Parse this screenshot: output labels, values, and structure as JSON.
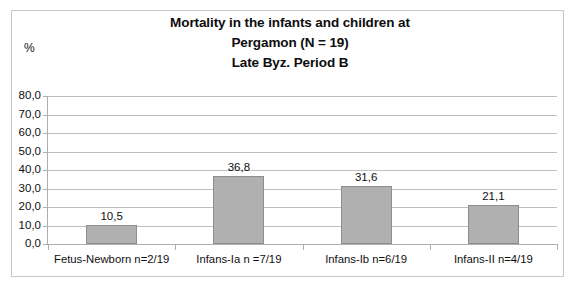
{
  "chart_data": {
    "type": "bar",
    "title": "Mortality in the infants and children at Pergamon  (N = 19) Late Byz. Period B",
    "title_lines": [
      "Mortality in the infants and children at",
      "Pergamon  (N = 19)",
      "Late Byz. Period B"
    ],
    "categories": [
      "Fetus-Newborn n=2/19",
      "Infans-Ia n =7/19",
      "Infans-Ib n=6/19",
      "Infans-II n=4/19"
    ],
    "values": [
      10.5,
      36.8,
      31.6,
      21.1
    ],
    "value_labels": [
      "10,5",
      "36,8",
      "31,6",
      "21,1"
    ],
    "xlabel": "",
    "ylabel": "%",
    "ylim": [
      0,
      80
    ],
    "ytick_values": [
      0,
      10,
      20,
      30,
      40,
      50,
      60,
      70,
      80
    ],
    "ytick_labels": [
      "0,0",
      "10,0",
      "20,0",
      "30,0",
      "40,0",
      "50,0",
      "60,0",
      "70,0",
      "80,0"
    ],
    "grid": true,
    "legend": false,
    "decimal_separator": ",",
    "bar_color": "#b0b0b0",
    "bar_border_color": "#8e8e8e",
    "gridline_color": "#bfbfbf",
    "axis_color": "#aeaeae",
    "text_color": "#0f0f0f",
    "background": "#ffffff"
  }
}
